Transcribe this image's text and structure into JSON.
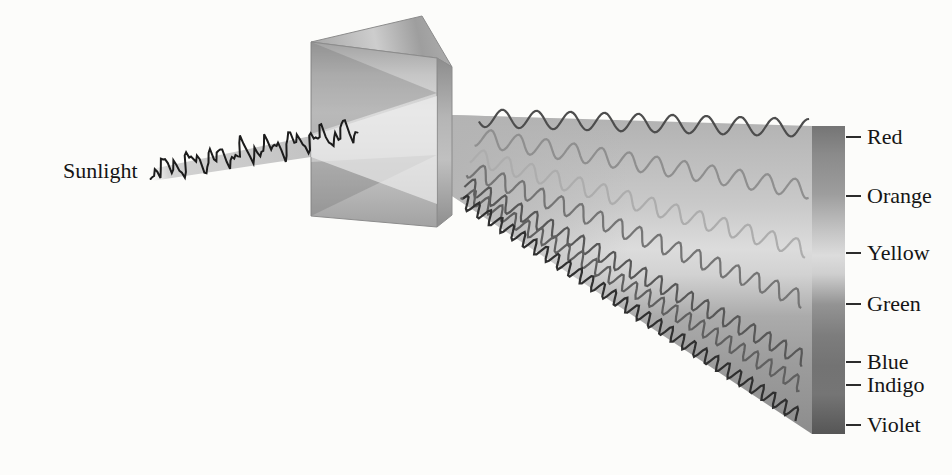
{
  "sunlight": {
    "label": "Sunlight"
  },
  "incoming_wave": {
    "color": "#1c1c1c",
    "start": [
      149,
      171
    ],
    "end": [
      359,
      130
    ],
    "components": [
      {
        "amplitude": 7.0,
        "wavelength": 26.0,
        "phase": 0.5
      },
      {
        "amplitude": 6.5,
        "wavelength": 11.5,
        "phase": 2.1
      },
      {
        "amplitude": 3.5,
        "wavelength": 6.3,
        "phase": 4.0
      },
      {
        "amplitude": 2.2,
        "wavelength": 17.0,
        "phase": 1.0
      }
    ]
  },
  "spectrum": {
    "bands": [
      {
        "label": "Red",
        "tick_y": 137,
        "wavelength": 34.0,
        "amplitude": 9.0,
        "color": "#4d4d4d",
        "start": [
          479,
          118
        ],
        "end": [
          810,
          128
        ],
        "phase": 0.4
      },
      {
        "label": "Orange",
        "tick_y": 196,
        "wavelength": 28.0,
        "amplitude": 9.0,
        "color": "#8f8f8f",
        "start": [
          476,
          137
        ],
        "end": [
          810,
          190
        ],
        "phase": 1.6
      },
      {
        "label": "Yellow",
        "tick_y": 253,
        "wavelength": 25.0,
        "amplitude": 8.5,
        "color": "#adadad",
        "start": [
          472,
          156
        ],
        "end": [
          808,
          250
        ],
        "phase": 2.2
      },
      {
        "label": "Green",
        "tick_y": 304,
        "wavelength": 21.0,
        "amplitude": 8.5,
        "color": "#757575",
        "start": [
          469,
          169
        ],
        "end": [
          806,
          301
        ],
        "phase": 0.9
      },
      {
        "label": "Blue",
        "tick_y": 362,
        "wavelength": 17.5,
        "amplitude": 8.0,
        "color": "#585858",
        "start": [
          466,
          184
        ],
        "end": [
          806,
          360
        ],
        "phase": 2.7
      },
      {
        "label": "Indigo",
        "tick_y": 385,
        "wavelength": 15.5,
        "amplitude": 7.5,
        "color": "#606060",
        "start": [
          464,
          192
        ],
        "end": [
          803,
          386
        ],
        "phase": 1.2
      },
      {
        "label": "Violet",
        "tick_y": 425,
        "wavelength": 13.5,
        "amplitude": 7.0,
        "color": "#303030",
        "start": [
          462,
          200
        ],
        "end": [
          799,
          416
        ],
        "phase": 3.4
      }
    ],
    "bar_gradient": [
      [
        "0",
        "#757575"
      ],
      [
        "0.09",
        "#8a8a8a"
      ],
      [
        "0.22",
        "#9d9d9d"
      ],
      [
        "0.34",
        "#c4c4c4"
      ],
      [
        "0.42",
        "#dcdcdc"
      ],
      [
        "0.48",
        "#cfcfcf"
      ],
      [
        "0.58",
        "#939393"
      ],
      [
        "0.68",
        "#7d7d7d"
      ],
      [
        "0.78",
        "#737373"
      ],
      [
        "0.87",
        "#757575"
      ],
      [
        "1",
        "#565656"
      ]
    ]
  }
}
